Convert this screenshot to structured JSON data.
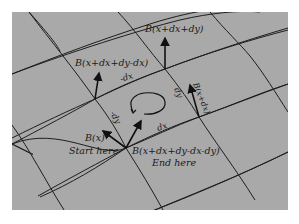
{
  "diagram": {
    "type": "parallel-transport-loop",
    "colors": {
      "background": "#ffffff",
      "panel": "#a9a9a9",
      "grid_line": "#1e1e1e",
      "arrow": "#111111",
      "text": "#1a1a1a"
    },
    "labels": {
      "b_top_left": "B(x+dx+dy-dx)",
      "b_top_right": "B(x+dx+dy)",
      "b_right": "B(x+dx)",
      "b_start": "B(x)",
      "start_here": "Start here",
      "b_end": "B(x+dx+dy-dx-dy)",
      "end_here": "End here",
      "edge_top": "-dx",
      "edge_right": "dy",
      "edge_bottom": "dx",
      "edge_left": "-dy"
    }
  }
}
